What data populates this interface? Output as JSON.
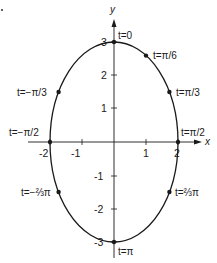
{
  "figure": {
    "type": "parametric-ellipse",
    "equations": {
      "x": "2 sin t",
      "y": "3 cos t"
    },
    "axes": {
      "x_label": "x",
      "y_label": "y",
      "x_ticks": [
        "-2",
        "-1",
        "1",
        "2"
      ],
      "y_ticks": [
        "3",
        "2",
        "1",
        "-1",
        "-2",
        "-3"
      ]
    },
    "points": [
      {
        "label": "t=0",
        "x": 0,
        "y": 3
      },
      {
        "label": "t=π/6",
        "x": 1,
        "y": 2.598
      },
      {
        "label": "t=π/3",
        "x": 1.732,
        "y": 1.5
      },
      {
        "label": "t=π/2",
        "x": 2,
        "y": 0
      },
      {
        "label": "t=⅔π",
        "x": 1.732,
        "y": -1.5
      },
      {
        "label": "t=π",
        "x": 0,
        "y": -3
      },
      {
        "label": "t=−⅔π",
        "x": -1.732,
        "y": -1.5
      },
      {
        "label": "t=−π/2",
        "x": -2,
        "y": 0
      },
      {
        "label": "t=−π/3",
        "x": -1.732,
        "y": 1.5
      }
    ],
    "colors": {
      "ink": "#1a1a1a",
      "background": "#ffffff"
    }
  }
}
